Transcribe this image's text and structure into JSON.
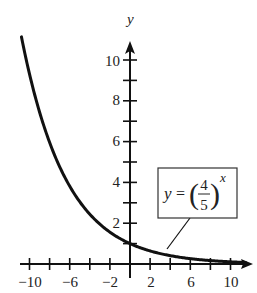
{
  "chart_data": {
    "type": "line",
    "title": "",
    "xlabel": "",
    "ylabel": "y",
    "xlim": [
      -11,
      12
    ],
    "ylim": [
      0,
      11
    ],
    "grid": false,
    "x_ticks": [
      -10,
      -8,
      -6,
      -4,
      -2,
      0,
      2,
      4,
      6,
      8,
      10
    ],
    "x_tick_labels": [
      "-10",
      "-6",
      "-2",
      "2",
      "6",
      "10"
    ],
    "x_tick_label_values": [
      -10,
      -6,
      -2,
      2,
      6,
      10
    ],
    "y_ticks": [
      1,
      2,
      3,
      4,
      5,
      6,
      7,
      8,
      9,
      10
    ],
    "y_tick_labels": [
      "2",
      "4",
      "6",
      "8",
      "10"
    ],
    "y_tick_label_values": [
      2,
      4,
      6,
      8,
      10
    ],
    "series": [
      {
        "name": "y = (4/5)^x",
        "function": "(4/5)^x",
        "x": [
          -10.8,
          -10,
          -8,
          -6,
          -4,
          -2,
          0,
          2,
          4,
          6,
          8,
          10,
          11.5
        ],
        "values": [
          11.14,
          9.31,
          5.96,
          3.81,
          2.44,
          1.56,
          1.0,
          0.64,
          0.41,
          0.26,
          0.17,
          0.11,
          0.08
        ]
      }
    ],
    "annotations": [
      {
        "text": "y = (4/5)^x",
        "type": "boxed-label-with-leader",
        "points_to_x": 3.5
      }
    ]
  },
  "labels": {
    "y_axis": "y",
    "eq_y": "y",
    "eq_equals": "=",
    "eq_num": "4",
    "eq_den": "5",
    "eq_exp": "x",
    "eq_lparen": "(",
    "eq_rparen": ")",
    "x_ticks": [
      "−10",
      "−6",
      "−2",
      "2",
      "6",
      "10"
    ],
    "y_ticks": [
      "2",
      "4",
      "6",
      "8",
      "10"
    ]
  }
}
